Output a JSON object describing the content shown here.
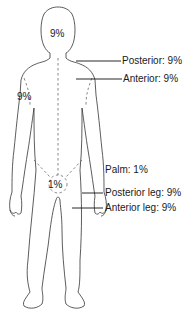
{
  "diagram": {
    "labels": {
      "head": "9%",
      "arm": "9%",
      "genital": "1%",
      "posterior_trunk": "Posterior: 9%",
      "anterior_trunk": "Anterior: 9%",
      "palm": "Palm: 1%",
      "posterior_leg": "Posterior leg: 9%",
      "anterior_leg": "Anterior leg: 9%"
    },
    "colors": {
      "stroke": "#333333",
      "text": "#1a1a1a",
      "background": "#ffffff"
    }
  }
}
